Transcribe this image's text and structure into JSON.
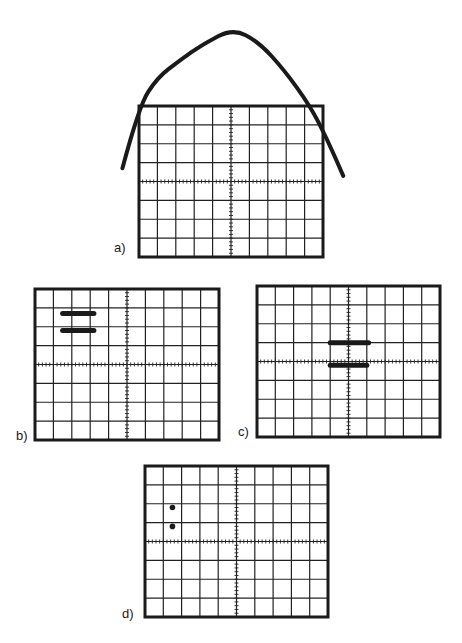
{
  "figure": {
    "colors": {
      "ink": "#1a1a1a",
      "grid": "#222222",
      "background": "#ffffff"
    },
    "screen_grid": {
      "columns": 10,
      "rows": 8,
      "minor_ticks_per_division": 5
    },
    "panels": [
      {
        "id": "a",
        "label": "a)",
        "trace": {
          "kind": "parabola-curve",
          "description": "Inverted parabola extending beyond screen top",
          "points_div": [
            [
              -0.9,
              4.7
            ],
            [
              0,
              8.0
            ],
            [
              1,
              9.5
            ],
            [
              2.2,
              10.4
            ],
            [
              3.5,
              11.3
            ],
            [
              5.1,
              12.1
            ],
            [
              6.5,
              11.4
            ],
            [
              7.9,
              9.9
            ],
            [
              9.3,
              8.0
            ],
            [
              10.2,
              6.3
            ],
            [
              11.1,
              4.3
            ]
          ]
        }
      },
      {
        "id": "b",
        "label": "b)",
        "trace": {
          "kind": "horizontal-bars",
          "bars": [
            {
              "x_start_div": 1.5,
              "x_end_div": 3.2,
              "y_div": 6.7
            },
            {
              "x_start_div": 1.5,
              "x_end_div": 3.2,
              "y_div": 5.8
            }
          ]
        }
      },
      {
        "id": "c",
        "label": "c)",
        "trace": {
          "kind": "horizontal-bars",
          "bars": [
            {
              "x_start_div": 4.0,
              "x_end_div": 6.1,
              "y_div": 5.0
            },
            {
              "x_start_div": 4.0,
              "x_end_div": 6.0,
              "y_div": 3.8
            }
          ]
        }
      },
      {
        "id": "d",
        "label": "d)",
        "trace": {
          "kind": "dots",
          "dots": [
            {
              "x_div": 1.5,
              "y_div": 5.8
            },
            {
              "x_div": 1.5,
              "y_div": 4.8
            }
          ]
        }
      }
    ]
  }
}
